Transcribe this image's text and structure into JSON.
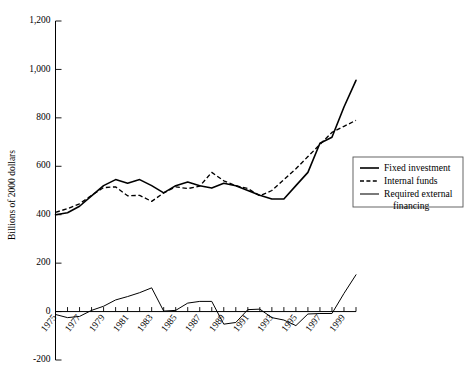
{
  "chart_data": {
    "type": "line",
    "title": "",
    "xlabel": "",
    "ylabel": "Billions of 2000 dollars",
    "ylim": [
      -200,
      1200
    ],
    "xlim": [
      1975,
      2000
    ],
    "yticks": [
      -200,
      0,
      200,
      400,
      600,
      800,
      1000,
      1200
    ],
    "ytick_labels": [
      "-200",
      "0",
      "200",
      "400",
      "600",
      "800",
      "1,000",
      "1,200"
    ],
    "xticks": [
      1975,
      1976,
      1977,
      1978,
      1979,
      1980,
      1981,
      1982,
      1983,
      1984,
      1985,
      1986,
      1987,
      1988,
      1989,
      1990,
      1991,
      1992,
      1993,
      1994,
      1995,
      1996,
      1997,
      1998,
      1999,
      2000
    ],
    "xtick_labels_shown": [
      "1975",
      "1977",
      "1979",
      "1981",
      "1983",
      "1985",
      "1987",
      "1989",
      "1991",
      "1993",
      "1995",
      "1997",
      "1999"
    ],
    "grid": false,
    "legend_position": "right-middle",
    "x": [
      1975,
      1976,
      1977,
      1978,
      1979,
      1980,
      1981,
      1982,
      1983,
      1984,
      1985,
      1986,
      1987,
      1988,
      1989,
      1990,
      1991,
      1992,
      1993,
      1994,
      1995,
      1996,
      1997,
      1998,
      1999,
      2000
    ],
    "series": [
      {
        "name": "Fixed investment",
        "style": "solid-thick",
        "values": [
          400,
          408,
          435,
          478,
          520,
          545,
          530,
          545,
          520,
          490,
          520,
          535,
          520,
          510,
          530,
          520,
          500,
          480,
          465,
          465,
          520,
          575,
          695,
          720,
          845,
          955
        ]
      },
      {
        "name": "Internal funds",
        "style": "dashed",
        "values": [
          410,
          425,
          445,
          480,
          512,
          515,
          478,
          480,
          455,
          490,
          515,
          508,
          518,
          575,
          540,
          520,
          508,
          478,
          500,
          545,
          590,
          640,
          690,
          740,
          765,
          790
        ]
      },
      {
        "name": "Required external financing",
        "style": "solid-thin",
        "values": [
          -12,
          -25,
          -20,
          5,
          22,
          48,
          62,
          78,
          98,
          2,
          5,
          35,
          42,
          42,
          -52,
          -45,
          8,
          10,
          -25,
          -35,
          -58,
          -10,
          -8,
          -8,
          75,
          152
        ]
      }
    ],
    "legend": [
      {
        "label": "Fixed investment",
        "style": "solid-thick"
      },
      {
        "label": "Internal funds",
        "style": "dashed"
      },
      {
        "label": "Required external financing",
        "style": "solid-thin"
      }
    ]
  }
}
